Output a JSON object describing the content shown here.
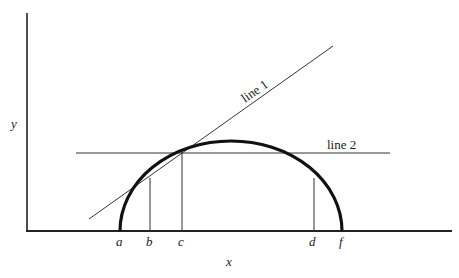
{
  "diagram": {
    "axes": {
      "x_label": "x",
      "y_label": "y"
    },
    "lines": [
      {
        "id": "line1",
        "label": "line 1",
        "description": "tangent line to curve at point c"
      },
      {
        "id": "line2",
        "label": "line 2",
        "description": "horizontal line through point c"
      }
    ],
    "points": [
      "a",
      "b",
      "c",
      "d",
      "f"
    ],
    "colors": {
      "stroke": "#222222",
      "background": "#ffffff"
    }
  }
}
